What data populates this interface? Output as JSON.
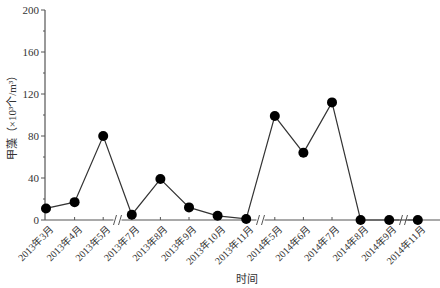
{
  "chart_data": {
    "type": "line",
    "title": "",
    "xlabel": "时间",
    "ylabel": "甲藻（×10³个/m³）",
    "ylim": [
      0,
      200
    ],
    "yticks": [
      0,
      40,
      80,
      120,
      160,
      200
    ],
    "grid": false,
    "legend": null,
    "categories": [
      "2013年3月",
      "2013年4月",
      "2013年5月",
      "2013年7月",
      "2013年8月",
      "2013年9月",
      "2013年10月",
      "2013年11月",
      "2014年5月",
      "2014年6月",
      "2014年7月",
      "2014年8月",
      "2014年9月",
      "2014年11月"
    ],
    "series": [
      {
        "name": "甲藻",
        "values": [
          11,
          17,
          80,
          5,
          39,
          12,
          4,
          1,
          99,
          64,
          112,
          0,
          0,
          0
        ],
        "color": "#000000",
        "marker": "circle"
      }
    ],
    "axis_breaks_after_index": [
      2,
      7,
      12
    ]
  },
  "colors": {
    "line": "#333333",
    "marker": "#000000",
    "axis": "#555555"
  }
}
